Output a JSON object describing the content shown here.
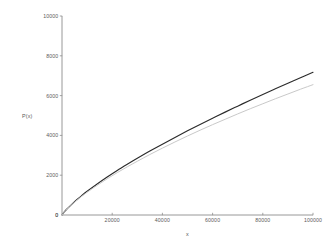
{
  "chart_data": {
    "type": "line",
    "title": "",
    "xlabel": "x",
    "ylabel": "P(x)",
    "xlim": [
      0,
      100000
    ],
    "ylim": [
      0,
      10000
    ],
    "grid": false,
    "legend": "none",
    "background": "#ffffff",
    "xticks": [
      0,
      20000,
      40000,
      60000,
      80000,
      100000
    ],
    "xticklabels": [
      "0",
      "20000",
      "40000",
      "60000",
      "80000",
      "100000"
    ],
    "yticks": [
      0,
      2000,
      4000,
      6000,
      8000,
      10000
    ],
    "yticklabels": [
      "0",
      "2000",
      "4000",
      "6000",
      "8000",
      "10000"
    ],
    "series": [
      {
        "name": "upper-curve",
        "color": "#2b2b2b",
        "width": 1.15,
        "x": [
          0,
          1000,
          2000,
          4000,
          6000,
          8000,
          10000,
          14000,
          18000,
          22000,
          26000,
          30000,
          35000,
          40000,
          45000,
          50000,
          55000,
          60000,
          65000,
          70000,
          75000,
          80000,
          85000,
          90000,
          95000,
          100000
        ],
        "y": [
          0,
          170,
          305,
          550,
          780,
          990,
          1190,
          1560,
          1910,
          2240,
          2550,
          2850,
          3210,
          3560,
          3900,
          4230,
          4550,
          4860,
          5170,
          5470,
          5770,
          6060,
          6340,
          6620,
          6900,
          7170
        ]
      },
      {
        "name": "lower-curve",
        "color": "#c9c9c9",
        "width": 1.0,
        "x": [
          0,
          1000,
          2000,
          4000,
          6000,
          8000,
          10000,
          14000,
          18000,
          22000,
          26000,
          30000,
          35000,
          40000,
          45000,
          50000,
          55000,
          60000,
          65000,
          70000,
          75000,
          80000,
          85000,
          90000,
          95000,
          100000
        ],
        "y": [
          0,
          165,
          295,
          530,
          750,
          950,
          1140,
          1490,
          1820,
          2130,
          2420,
          2700,
          3040,
          3360,
          3670,
          3970,
          4260,
          4540,
          4810,
          5080,
          5340,
          5590,
          5840,
          6080,
          6320,
          6550
        ]
      }
    ],
    "notes": {
      "upper_curve_end_value": "9650",
      "lower_curve_end_value": "8700",
      "shape": "concave-down, sqrt-like growth from origin"
    }
  },
  "geometry": {
    "plot_left": 62,
    "plot_right": 313,
    "plot_top": 16,
    "plot_bottom": 215
  }
}
